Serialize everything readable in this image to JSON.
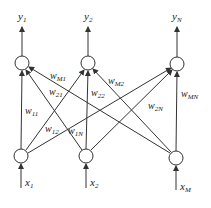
{
  "diagram": {
    "title": "",
    "outputs": [
      {
        "id": "y1",
        "label": "y",
        "sub": "1",
        "x": 22,
        "y": 63
      },
      {
        "id": "y2",
        "label": "y",
        "sub": "2",
        "x": 88,
        "y": 63
      },
      {
        "id": "yN",
        "label": "y",
        "sub": "N",
        "x": 177,
        "y": 64
      }
    ],
    "inputs": [
      {
        "id": "x1",
        "label": "x",
        "sub": "1",
        "x": 21,
        "y": 156
      },
      {
        "id": "x2",
        "label": "x",
        "sub": "2",
        "x": 86,
        "y": 156
      },
      {
        "id": "xM",
        "label": "x",
        "sub": "M",
        "x": 176,
        "y": 158
      }
    ],
    "weights": [
      {
        "from": "x1",
        "to": "y1",
        "label": "w",
        "sub": "11"
      },
      {
        "from": "x1",
        "to": "y2",
        "label": "w",
        "sub": "12"
      },
      {
        "from": "x1",
        "to": "yN",
        "label": "w",
        "sub": "1N"
      },
      {
        "from": "x2",
        "to": "y1",
        "label": "w",
        "sub": "21"
      },
      {
        "from": "x2",
        "to": "y2",
        "label": "w",
        "sub": "22"
      },
      {
        "from": "x2",
        "to": "yN",
        "label": "w",
        "sub": "2N"
      },
      {
        "from": "xM",
        "to": "y1",
        "label": "w",
        "sub": "M1"
      },
      {
        "from": "xM",
        "to": "y2",
        "label": "w",
        "sub": "M2"
      },
      {
        "from": "xM",
        "to": "yN",
        "label": "w",
        "sub": "MN"
      }
    ],
    "colors": {
      "line": "#333333",
      "text": "#222222",
      "background": "#ffffff"
    }
  }
}
